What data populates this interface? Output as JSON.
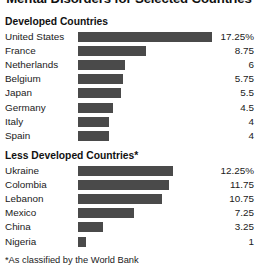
{
  "chart_data": {
    "type": "bar",
    "title": "Mental Disorders for Selected Countries",
    "orientation": "horizontal",
    "xlabel": "",
    "ylabel": "",
    "grid": false,
    "legend": false,
    "value_suffix_first_row": "%",
    "xlim": [
      0,
      17.25
    ],
    "footnote": "*As classified by the World Bank",
    "groups": [
      {
        "name": "Developed Countries",
        "categories": [
          "United States",
          "France",
          "Netherlands",
          "Belgium",
          "Japan",
          "Germany",
          "Italy",
          "Spain"
        ],
        "values": [
          17.25,
          8.75,
          6,
          5.75,
          5.5,
          4.5,
          4,
          4
        ],
        "value_labels": [
          "17.25%",
          "8.75",
          "6",
          "5.75",
          "5.5",
          "4.5",
          "4",
          "4"
        ]
      },
      {
        "name": "Less Developed Countries*",
        "categories": [
          "Ukraine",
          "Colombia",
          "Lebanon",
          "Mexico",
          "China",
          "Nigeria"
        ],
        "values": [
          12.25,
          11.75,
          10.75,
          7.25,
          3.25,
          1
        ],
        "value_labels": [
          "12.25%",
          "11.75",
          "10.75",
          "7.25",
          "3.25",
          "1"
        ]
      }
    ]
  },
  "style": {
    "bar_color": "#4a4a4a",
    "background": "#ffffff",
    "text_color": "#1a1a1a"
  }
}
